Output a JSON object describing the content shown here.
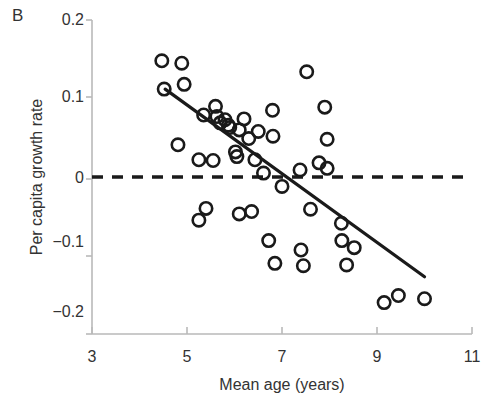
{
  "figure": {
    "panel_label": "B",
    "xlabel": "Mean age (years)",
    "ylabel": "Per capita growth rate"
  },
  "axis": {
    "x_ticks": [
      "3",
      "5",
      "7",
      "9",
      "11"
    ],
    "y_ticks": [
      "0.2",
      "0.1",
      "0",
      "−0.1",
      "−0.2"
    ]
  },
  "chart_data": {
    "type": "scatter",
    "title": "B",
    "xlabel": "Mean age (years)",
    "ylabel": "Per capita growth rate",
    "xlim": [
      3,
      11
    ],
    "ylim": [
      -0.2,
      0.2
    ],
    "xticks": [
      3,
      5,
      7,
      9,
      11
    ],
    "yticks": [
      0.2,
      0.1,
      0,
      -0.1,
      -0.2
    ],
    "grid": false,
    "legend": "none",
    "marker": "open-circle",
    "series": [
      {
        "name": "populations",
        "points": [
          [
            4.47,
            0.148
          ],
          [
            4.89,
            0.145
          ],
          [
            4.94,
            0.118
          ],
          [
            4.52,
            0.112
          ],
          [
            4.81,
            0.041
          ],
          [
            5.25,
            0.022
          ],
          [
            5.35,
            0.079
          ],
          [
            5.63,
            0.077
          ],
          [
            5.8,
            0.073
          ],
          [
            5.7,
            0.069
          ],
          [
            5.87,
            0.066
          ],
          [
            5.9,
            0.063
          ],
          [
            6.2,
            0.074
          ],
          [
            6.1,
            0.06
          ],
          [
            6.5,
            0.058
          ],
          [
            6.81,
            0.052
          ],
          [
            6.3,
            0.049
          ],
          [
            6.02,
            0.032
          ],
          [
            6.05,
            0.026
          ],
          [
            6.43,
            0.022
          ],
          [
            5.55,
            0.021
          ],
          [
            6.61,
            0.005
          ],
          [
            7.0,
            -0.012
          ],
          [
            7.38,
            0.009
          ],
          [
            7.78,
            0.018
          ],
          [
            5.25,
            -0.055
          ],
          [
            5.4,
            -0.04
          ],
          [
            6.1,
            -0.047
          ],
          [
            6.36,
            -0.044
          ],
          [
            6.72,
            -0.081
          ],
          [
            6.85,
            -0.11
          ],
          [
            7.4,
            -0.093
          ],
          [
            7.6,
            -0.041
          ],
          [
            7.95,
            0.011
          ],
          [
            7.45,
            -0.113
          ],
          [
            7.52,
            0.134
          ],
          [
            7.9,
            0.089
          ],
          [
            7.95,
            0.048
          ],
          [
            8.25,
            -0.059
          ],
          [
            8.26,
            -0.081
          ],
          [
            8.52,
            -0.09
          ],
          [
            8.36,
            -0.112
          ],
          [
            9.15,
            -0.16
          ],
          [
            9.45,
            -0.151
          ],
          [
            10.0,
            -0.155
          ],
          [
            5.6,
            0.09
          ],
          [
            6.8,
            0.085
          ]
        ]
      }
    ],
    "trend_line": {
      "style": "solid",
      "x0": 4.54,
      "y0": 0.112,
      "x1": 10.0,
      "y1": -0.127
    },
    "reference_line": {
      "style": "dashed",
      "y": 0,
      "x0": 3.0,
      "x1": 10.95
    }
  }
}
